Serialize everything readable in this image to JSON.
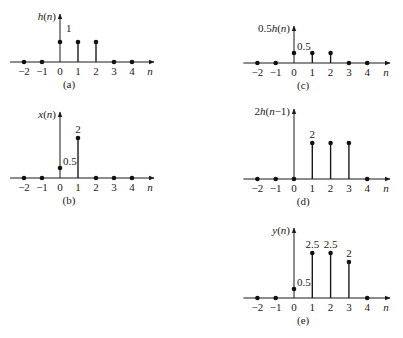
{
  "chart_data": [
    {
      "id": "a",
      "type": "stem",
      "caption": "(a)",
      "ylabel": "h(n)",
      "xlabel": "n",
      "x": [
        -2,
        -1,
        0,
        1,
        2,
        3,
        4
      ],
      "values": [
        0,
        0,
        1,
        1,
        1,
        0,
        0
      ],
      "annotations": [
        {
          "n": 0,
          "text": "1",
          "pos": "axis-right"
        }
      ],
      "origin": {
        "x0": 60,
        "y0": 62,
        "dx": 18.0,
        "unit": 20,
        "ytop": 14,
        "xend": 154
      }
    },
    {
      "id": "b",
      "type": "stem",
      "caption": "(b)",
      "ylabel": "x(n)",
      "xlabel": "n",
      "x": [
        -2,
        -1,
        0,
        1,
        2,
        3,
        4
      ],
      "values": [
        0,
        0,
        0.5,
        2,
        0,
        0,
        0
      ],
      "annotations": [
        {
          "n": 0,
          "text": "0.5",
          "pos": "right"
        },
        {
          "n": 1,
          "text": "2",
          "pos": "top"
        }
      ],
      "origin": {
        "x0": 60,
        "y0": 178,
        "dx": 18.0,
        "unit": 20,
        "ytop": 112,
        "xend": 154
      }
    },
    {
      "id": "c",
      "type": "stem",
      "caption": "(c)",
      "ylabel": "0.5h(n)",
      "xlabel": "n",
      "x": [
        -2,
        -1,
        0,
        1,
        2,
        3,
        4
      ],
      "values": [
        0,
        0,
        0.5,
        0.5,
        0.5,
        0,
        0
      ],
      "annotations": [
        {
          "n": 0,
          "text": "0.5",
          "pos": "right"
        }
      ],
      "origin": {
        "x0": 294,
        "y0": 63,
        "dx": 18.3,
        "unit": 20,
        "ytop": 26,
        "xend": 390
      }
    },
    {
      "id": "d",
      "type": "stem",
      "caption": "(d)",
      "ylabel": "2h(n−1)",
      "xlabel": "n",
      "x": [
        -2,
        -1,
        0,
        1,
        2,
        3,
        4
      ],
      "values": [
        0,
        0,
        0,
        2,
        2,
        2,
        0
      ],
      "annotations": [
        {
          "n": 1,
          "text": "2",
          "pos": "top"
        }
      ],
      "origin": {
        "x0": 294,
        "y0": 179,
        "dx": 18.3,
        "unit": 18,
        "ytop": 109,
        "xend": 390
      }
    },
    {
      "id": "e",
      "type": "stem",
      "caption": "(e)",
      "ylabel": "y(n)",
      "xlabel": "n",
      "x": [
        -2,
        -1,
        0,
        1,
        2,
        3,
        4
      ],
      "values": [
        0,
        0,
        0.5,
        2.5,
        2.5,
        2,
        0
      ],
      "annotations": [
        {
          "n": 0,
          "text": "0.5",
          "pos": "right"
        },
        {
          "n": 1,
          "text": "2.5",
          "pos": "top"
        },
        {
          "n": 2,
          "text": "2.5",
          "pos": "top"
        },
        {
          "n": 3,
          "text": "2",
          "pos": "top"
        }
      ],
      "origin": {
        "x0": 294,
        "y0": 298,
        "dx": 18.3,
        "unit": 18,
        "ytop": 228,
        "xend": 390
      }
    }
  ],
  "tick_labels": [
    "−2",
    "−1",
    "0",
    "1",
    "2",
    "3",
    "4"
  ]
}
